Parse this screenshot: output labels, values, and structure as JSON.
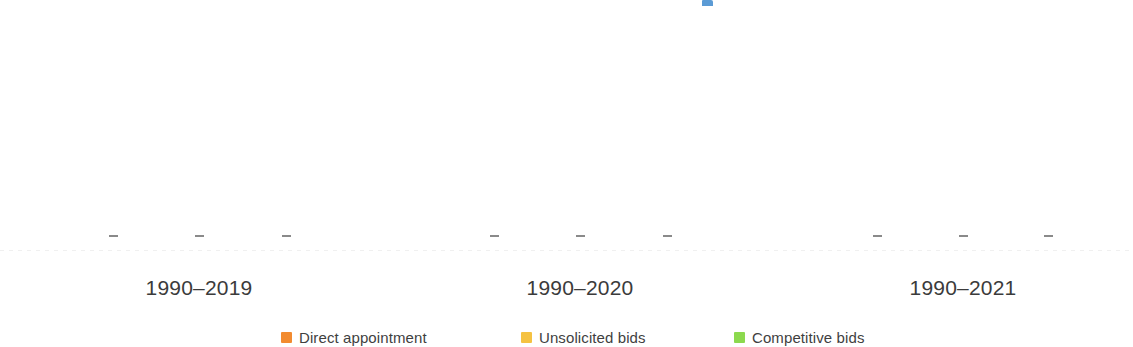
{
  "chart_data": {
    "type": "bar",
    "title": "",
    "subtitle": "",
    "xlabel": "",
    "ylabel": "",
    "grid": false,
    "legend_position": "bottom",
    "note": "Only the bottom strip of a grouped bar chart is visible; bar bodies are cropped above the top edge of the screenshot. Nine axis tick marks appear in three groups of three, one tick per series within each period group.",
    "categories": [
      "1990–2019",
      "1990–2020",
      "1990–2021"
    ],
    "series": [
      {
        "name": "Direct appointment",
        "color": "#F28B30",
        "values": [
          null,
          null,
          null
        ]
      },
      {
        "name": "Unsolicited bids",
        "color": "#F5C242",
        "values": [
          null,
          null,
          null
        ]
      },
      {
        "name": "Competitive bids",
        "color": "#8CD94E",
        "values": [
          null,
          null,
          null
        ]
      }
    ],
    "tick_marks": [
      {
        "x": 113,
        "group": "1990–2019",
        "series": "Direct appointment"
      },
      {
        "x": 199,
        "group": "1990–2019",
        "series": "Unsolicited bids"
      },
      {
        "x": 286,
        "group": "1990–2019",
        "series": "Competitive bids"
      },
      {
        "x": 494,
        "group": "1990–2020",
        "series": "Direct appointment"
      },
      {
        "x": 580,
        "group": "1990–2020",
        "series": "Unsolicited bids"
      },
      {
        "x": 667,
        "group": "1990–2020",
        "series": "Competitive bids"
      },
      {
        "x": 877,
        "group": "1990–2021",
        "series": "Direct appointment"
      },
      {
        "x": 963,
        "group": "1990–2021",
        "series": "Unsolicited bids"
      },
      {
        "x": 1048,
        "group": "1990–2021",
        "series": "Competitive bids"
      }
    ],
    "clipped_elements": [
      {
        "name": "clipped-blue-bar",
        "x": 702,
        "y": 0,
        "width": 11,
        "height": 6,
        "color": "#5B9BD5"
      }
    ]
  },
  "axis": {
    "categories": [
      {
        "label": "1990–2019",
        "center_x": 199
      },
      {
        "label": "1990–2020",
        "center_x": 580
      },
      {
        "label": "1990–2021",
        "center_x": 963
      }
    ],
    "tick_color": "#8A8A8A",
    "baseline_color": "#F0F0F0"
  },
  "legend": {
    "items": [
      {
        "label": "Direct appointment",
        "color": "#F28B30",
        "x": 281
      },
      {
        "label": "Unsolicited bids",
        "color": "#F5C242",
        "x": 521
      },
      {
        "label": "Competitive bids",
        "color": "#8CD94E",
        "x": 734
      }
    ]
  },
  "colors": {
    "background": "#FFFFFF",
    "direct_appointment": "#F28B30",
    "unsolicited_bids": "#F5C242",
    "competitive_bids": "#8CD94E",
    "clipped_blue": "#5B9BD5",
    "label_text": "#3B3B3B",
    "legend_text": "#3F3F3F"
  }
}
